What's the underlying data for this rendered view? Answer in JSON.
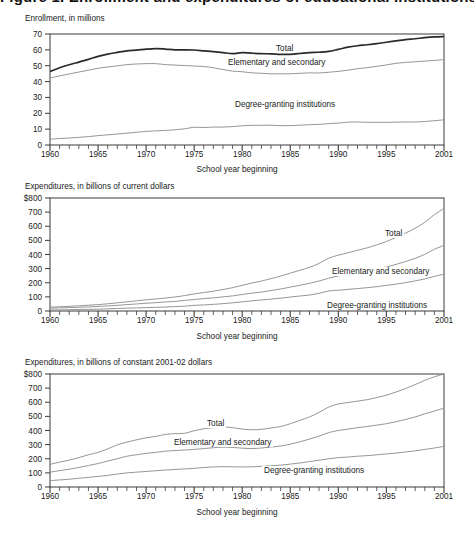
{
  "title": "Figure 1. Enrollment and expenditures of educational institutions",
  "xlabel": "School year beginning",
  "series_names": [
    "Total",
    "Elementary and secondary",
    "Degree-granting institutions"
  ],
  "panels": [
    {
      "axis_note": "Enrollment, in millions",
      "xlabel": "School year beginning",
      "ytick_labels": [
        "70",
        "60",
        "50",
        "40",
        "30",
        "20",
        "10",
        "0"
      ],
      "xtick_labels": [
        "1960",
        "1965",
        "1970",
        "1975",
        "1980",
        "1985",
        "1990",
        "1995",
        "2001"
      ],
      "label_total": "Total",
      "label_elem": "Elementary and secondary",
      "label_degree": "Degree-granting institutions"
    },
    {
      "axis_note": "Expenditures, in billions of current dollars",
      "xlabel": "School year beginning",
      "ytick_labels": [
        "$800",
        "700",
        "600",
        "500",
        "400",
        "300",
        "200",
        "100",
        "0"
      ],
      "xtick_labels": [
        "1960",
        "1965",
        "1970",
        "1975",
        "1980",
        "1985",
        "1990",
        "1995",
        "2001"
      ],
      "label_total": "Total",
      "label_elem": "Elementary and secondary",
      "label_degree": "Degree-granting institutions"
    },
    {
      "axis_note": "Expenditures, in billions of constant 2001-02 dollars",
      "xlabel": "School year beginning",
      "ytick_labels": [
        "$800",
        "700",
        "600",
        "500",
        "400",
        "300",
        "200",
        "100",
        "0"
      ],
      "xtick_labels": [
        "1960",
        "1965",
        "1970",
        "1975",
        "1980",
        "1985",
        "1990",
        "1995",
        "2001"
      ],
      "label_total": "Total",
      "label_elem": "Elementary and secondary",
      "label_degree": "Degree-granting institutions"
    }
  ],
  "chart_data": [
    {
      "type": "line",
      "title": "Enrollment, in millions",
      "xlabel": "School year beginning",
      "ylabel": "Enrollment, in millions",
      "ylim": [
        0,
        70
      ],
      "xlim": [
        1960,
        2001
      ],
      "yticks": [
        0,
        10,
        20,
        30,
        40,
        50,
        60,
        70
      ],
      "xticks": [
        1960,
        1965,
        1970,
        1975,
        1980,
        1985,
        1990,
        1995,
        2001
      ],
      "grid": false,
      "legend": "inline-annotations",
      "x": [
        1960,
        1961,
        1962,
        1963,
        1964,
        1965,
        1966,
        1967,
        1968,
        1969,
        1970,
        1971,
        1972,
        1973,
        1974,
        1975,
        1976,
        1977,
        1978,
        1979,
        1980,
        1981,
        1982,
        1983,
        1984,
        1985,
        1986,
        1987,
        1988,
        1989,
        1990,
        1991,
        1992,
        1993,
        1994,
        1995,
        1996,
        1997,
        1998,
        1999,
        2000,
        2001
      ],
      "series": [
        {
          "name": "Total",
          "values": [
            46.3,
            48.7,
            50.6,
            52.3,
            54.0,
            55.9,
            57.3,
            58.4,
            59.4,
            59.8,
            60.4,
            60.8,
            60.5,
            60.0,
            60.0,
            59.9,
            59.4,
            58.9,
            58.3,
            57.6,
            58.3,
            57.9,
            57.6,
            57.5,
            57.2,
            57.2,
            57.7,
            58.3,
            58.5,
            59.0,
            60.3,
            61.7,
            62.6,
            63.2,
            63.9,
            64.8,
            65.7,
            66.5,
            67.0,
            67.7,
            68.2,
            68.4
          ]
        },
        {
          "name": "Elementary and secondary",
          "values": [
            42.2,
            43.6,
            44.8,
            46.0,
            47.2,
            48.4,
            49.2,
            49.9,
            50.7,
            51.1,
            51.3,
            51.3,
            50.7,
            50.4,
            50.1,
            49.8,
            49.5,
            48.7,
            47.6,
            46.6,
            46.2,
            45.5,
            45.2,
            44.9,
            44.9,
            44.9,
            45.2,
            45.5,
            45.4,
            45.9,
            46.4,
            47.2,
            48.1,
            48.8,
            49.6,
            50.5,
            51.5,
            52.1,
            52.5,
            52.9,
            53.3,
            53.9
          ]
        },
        {
          "name": "Degree-granting institutions",
          "values": [
            3.6,
            4.1,
            4.4,
            4.8,
            5.3,
            5.9,
            6.4,
            6.9,
            7.5,
            8.0,
            8.6,
            8.9,
            9.2,
            9.6,
            10.2,
            11.2,
            11.0,
            11.3,
            11.3,
            11.6,
            12.1,
            12.4,
            12.4,
            12.5,
            12.2,
            12.2,
            12.5,
            12.8,
            13.0,
            13.5,
            13.8,
            14.4,
            14.5,
            14.3,
            14.3,
            14.3,
            14.4,
            14.5,
            14.5,
            14.8,
            15.3,
            15.9
          ]
        }
      ]
    },
    {
      "type": "line",
      "title": "Expenditures, in billions of current dollars",
      "xlabel": "School year beginning",
      "ylabel": "Expenditures, in billions of current dollars",
      "ylim": [
        0,
        800
      ],
      "xlim": [
        1960,
        2001
      ],
      "yticks": [
        0,
        100,
        200,
        300,
        400,
        500,
        600,
        700,
        800
      ],
      "xticks": [
        1960,
        1965,
        1970,
        1975,
        1980,
        1985,
        1990,
        1995,
        2001
      ],
      "grid": false,
      "legend": "inline-annotations",
      "x": [
        1960,
        1961,
        1962,
        1963,
        1964,
        1965,
        1966,
        1967,
        1968,
        1969,
        1970,
        1971,
        1972,
        1973,
        1974,
        1975,
        1976,
        1977,
        1978,
        1979,
        1980,
        1981,
        1982,
        1983,
        1984,
        1985,
        1986,
        1987,
        1988,
        1989,
        1990,
        1991,
        1992,
        1993,
        1994,
        1995,
        1996,
        1997,
        1998,
        1999,
        2000,
        2001
      ],
      "series": [
        {
          "name": "Total",
          "values": [
            27,
            30,
            33,
            37,
            41,
            45,
            51,
            58,
            65,
            72,
            79,
            85,
            92,
            99,
            109,
            121,
            131,
            140,
            152,
            165,
            182,
            198,
            212,
            229,
            247,
            268,
            288,
            309,
            337,
            374,
            395,
            412,
            430,
            447,
            468,
            492,
            520,
            551,
            586,
            628,
            682,
            726
          ]
        },
        {
          "name": "Elementary and secondary",
          "values": [
            20,
            22,
            24,
            26,
            29,
            32,
            36,
            40,
            45,
            50,
            55,
            59,
            64,
            68,
            75,
            81,
            88,
            93,
            100,
            107,
            117,
            126,
            134,
            145,
            156,
            169,
            182,
            196,
            212,
            232,
            248,
            259,
            271,
            282,
            296,
            311,
            330,
            350,
            373,
            401,
            437,
            465
          ]
        },
        {
          "name": "Degree-granting institutions",
          "values": [
            7,
            8,
            9,
            11,
            12,
            13,
            15,
            18,
            20,
            22,
            24,
            26,
            28,
            31,
            34,
            40,
            43,
            47,
            52,
            58,
            65,
            72,
            78,
            84,
            91,
            99,
            106,
            113,
            125,
            142,
            147,
            153,
            159,
            165,
            172,
            181,
            190,
            201,
            213,
            227,
            245,
            261
          ]
        }
      ]
    },
    {
      "type": "line",
      "title": "Expenditures, in billions of constant 2001-02 dollars",
      "xlabel": "School year beginning",
      "ylabel": "Expenditures, in billions of constant 2001-02 dollars",
      "ylim": [
        0,
        800
      ],
      "xlim": [
        1960,
        2001
      ],
      "yticks": [
        0,
        100,
        200,
        300,
        400,
        500,
        600,
        700,
        800
      ],
      "xticks": [
        1960,
        1965,
        1970,
        1975,
        1980,
        1985,
        1990,
        1995,
        2001
      ],
      "grid": false,
      "legend": "inline-annotations",
      "x": [
        1960,
        1961,
        1962,
        1963,
        1964,
        1965,
        1966,
        1967,
        1968,
        1969,
        1970,
        1971,
        1972,
        1973,
        1974,
        1975,
        1976,
        1977,
        1978,
        1979,
        1980,
        1981,
        1982,
        1983,
        1984,
        1985,
        1986,
        1987,
        1988,
        1989,
        1990,
        1991,
        1992,
        1993,
        1994,
        1995,
        1996,
        1997,
        1998,
        1999,
        2000,
        2001
      ],
      "series": [
        {
          "name": "Total",
          "values": [
            160,
            176,
            190,
            208,
            228,
            245,
            270,
            298,
            318,
            334,
            348,
            358,
            372,
            378,
            380,
            398,
            412,
            420,
            425,
            420,
            410,
            405,
            408,
            418,
            428,
            448,
            472,
            496,
            528,
            566,
            588,
            598,
            608,
            618,
            633,
            650,
            672,
            697,
            725,
            755,
            780,
            800
          ]
        },
        {
          "name": "Elementary and secondary",
          "values": [
            105,
            116,
            126,
            138,
            152,
            166,
            184,
            200,
            218,
            228,
            238,
            245,
            254,
            258,
            262,
            266,
            272,
            278,
            282,
            280,
            275,
            272,
            276,
            283,
            290,
            303,
            320,
            339,
            360,
            385,
            400,
            410,
            420,
            428,
            438,
            448,
            462,
            478,
            496,
            518,
            538,
            558
          ]
        },
        {
          "name": "Degree-granting institutions",
          "values": [
            45,
            50,
            55,
            62,
            68,
            75,
            82,
            92,
            100,
            105,
            110,
            115,
            120,
            124,
            128,
            132,
            138,
            142,
            144,
            143,
            142,
            143,
            146,
            150,
            155,
            162,
            170,
            180,
            190,
            200,
            208,
            212,
            218,
            222,
            228,
            234,
            240,
            248,
            256,
            266,
            276,
            288
          ]
        }
      ]
    }
  ]
}
